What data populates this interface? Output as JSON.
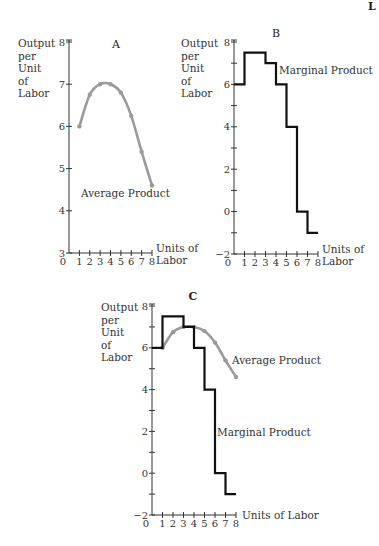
{
  "corner_text": "L",
  "chart_data": [
    {
      "panel": "A",
      "type": "line",
      "title": "A",
      "ylabel": "Output per Unit of Labor",
      "xlabel": "Units of Labor",
      "x": [
        1,
        2,
        3,
        4,
        5,
        6,
        7,
        8
      ],
      "series": [
        {
          "name": "Average Product",
          "values": [
            6.0,
            6.75,
            7.0,
            7.0,
            6.8,
            6.25,
            5.4,
            4.6
          ],
          "color": "#9a9a9a"
        }
      ],
      "xticks": [
        0,
        1,
        2,
        3,
        4,
        5,
        6,
        7,
        8
      ],
      "yticks": [
        3,
        4,
        5,
        6,
        7,
        8
      ],
      "ylim": [
        3,
        8
      ],
      "xlim": [
        0,
        8
      ],
      "annotations": [
        "Average Product"
      ]
    },
    {
      "panel": "B",
      "type": "line",
      "title": "B",
      "ylabel": "Output per Unit of Labor",
      "xlabel": "Units of Labor",
      "step": true,
      "x_intervals": [
        [
          0,
          1
        ],
        [
          1,
          2
        ],
        [
          2,
          3
        ],
        [
          3,
          4
        ],
        [
          4,
          5
        ],
        [
          5,
          6
        ],
        [
          6,
          7
        ],
        [
          7,
          8
        ]
      ],
      "series": [
        {
          "name": "Marginal Product",
          "values": [
            6,
            7.5,
            7.5,
            7,
            6,
            4,
            0,
            -1
          ],
          "color": "#111111"
        }
      ],
      "xticks": [
        0,
        1,
        2,
        3,
        4,
        5,
        6,
        7,
        8
      ],
      "yticks": [
        -2,
        0,
        2,
        4,
        6,
        8
      ],
      "ylim": [
        -2,
        8
      ],
      "xlim": [
        0,
        8
      ],
      "annotations": [
        "Marginal Product"
      ]
    },
    {
      "panel": "C",
      "type": "line",
      "title": "C",
      "ylabel": "Output per Unit of Labor",
      "xlabel": "Units of Labor",
      "series": [
        {
          "name": "Average Product",
          "x": [
            1,
            2,
            3,
            4,
            5,
            6,
            7,
            8
          ],
          "values": [
            6.0,
            6.75,
            7.0,
            7.0,
            6.8,
            6.25,
            5.4,
            4.6
          ],
          "color": "#9a9a9a"
        },
        {
          "name": "Marginal Product",
          "step": true,
          "values": [
            6,
            7.5,
            7.5,
            7,
            6,
            4,
            0,
            -1
          ],
          "color": "#111111"
        }
      ],
      "xticks": [
        0,
        1,
        2,
        3,
        4,
        5,
        6,
        7,
        8
      ],
      "yticks": [
        -2,
        0,
        2,
        4,
        6,
        8
      ],
      "ylim": [
        -2,
        8
      ],
      "xlim": [
        0,
        8
      ],
      "annotations": [
        "Average Product",
        "Marginal Product"
      ]
    }
  ],
  "labels": {
    "A": {
      "title": "A",
      "ylabel_lines": [
        "Output",
        "per",
        "Unit",
        "of",
        "Labor"
      ],
      "xlabel_lines": [
        "Units of",
        "Labor"
      ],
      "curve": "Average Product"
    },
    "B": {
      "title": "B",
      "ylabel_lines": [
        "Output",
        "per",
        "Unit",
        "of",
        "Labor"
      ],
      "xlabel_lines": [
        "Units of",
        "Labor"
      ],
      "curve": "Marginal Product"
    },
    "C": {
      "title": "C",
      "ylabel_lines": [
        "Output",
        "per",
        "Unit",
        "of",
        "Labor"
      ],
      "xlabel": "Units of Labor",
      "curve_ap": "Average Product",
      "curve_mp": "Marginal Product"
    }
  }
}
